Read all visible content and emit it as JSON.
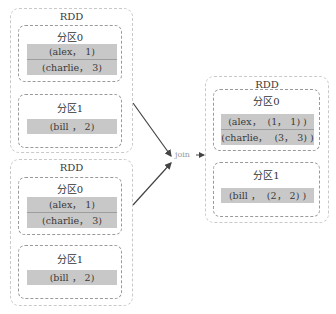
{
  "inputs": [
    {
      "title": "RDD",
      "partitions": [
        {
          "label": "分区0",
          "rows": [
            "(alex， 1)",
            "(charlie， 3)"
          ]
        },
        {
          "label": "分区1",
          "rows": [
            "(bill ， 2)"
          ]
        }
      ]
    },
    {
      "title": "RDD",
      "partitions": [
        {
          "label": "分区0",
          "rows": [
            "(alex， 1)",
            "(charlie， 3)"
          ]
        },
        {
          "label": "分区1",
          "rows": [
            "(bill ， 2)"
          ]
        }
      ]
    }
  ],
  "operation": {
    "label": "join"
  },
  "output": {
    "title": "RDD",
    "partitions": [
      {
        "label": "分区0",
        "rows": [
          "(alex，  (1， 1) )",
          "(charlie，  (3， 3) )"
        ]
      },
      {
        "label": "分区1",
        "rows": [
          "(bill ，  (2， 2) )"
        ]
      }
    ]
  },
  "colors": {
    "row_fill": "#c8c8c8",
    "arrow": "#444444",
    "border_outer": "#c9c9c9",
    "border_inner": "#9a9a9a"
  }
}
